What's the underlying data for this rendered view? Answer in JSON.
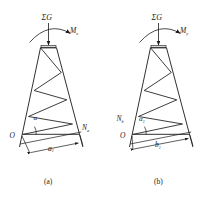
{
  "figure": {
    "title_caption_a": "(a)",
    "title_caption_b": "(b)"
  },
  "panel_a": {
    "name": "tower-diagram-a",
    "load_label": "ΣG",
    "moment_label": "M",
    "moment_sub": "x",
    "origin_label": "O",
    "reaction_label": "N",
    "reaction_sub": "a",
    "angle_label": "α",
    "angle_sub": "",
    "dimension_label": "a",
    "dimension_sub": "1",
    "caption": "(a)"
  },
  "panel_b": {
    "name": "tower-diagram-b",
    "load_label": "ΣG",
    "moment_label": "M",
    "moment_sub": "y",
    "origin_label": "O",
    "reaction_label": "N",
    "reaction_sub": "b",
    "angle_label": "α",
    "angle_sub": "1",
    "dimension_label": "b",
    "dimension_sub": "1",
    "caption": "(b)"
  },
  "colors": {
    "stroke": "#1a1a1a",
    "background": "#ffffff",
    "cap_fill": "#d9d9d9"
  }
}
